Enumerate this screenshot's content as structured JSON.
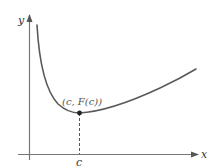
{
  "diagram": {
    "axes": {
      "x_label": "x",
      "y_label": "y",
      "color": "#777777"
    },
    "curve": {
      "description": "convex curve decreasing steeply near y-axis to a minimum then increasing",
      "color": "#5a5a5a"
    },
    "minimum_point": {
      "label": "(c, F(c))",
      "color": "#222222"
    },
    "tick": {
      "label": "c"
    },
    "dashed_line": {
      "color": "#555555"
    }
  }
}
